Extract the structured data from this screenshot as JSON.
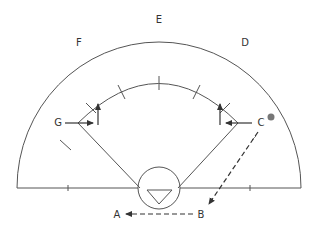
{
  "diagram": {
    "type": "field-positions-diagram",
    "colors": {
      "line": "#555555",
      "label": "#333333",
      "dot": "#777777",
      "background": "#ffffff"
    },
    "labels": {
      "E": "E",
      "F": "F",
      "D": "D",
      "G": "G",
      "C": "C",
      "A": "A",
      "B": "B"
    },
    "elements": {
      "outer_arc": "semicircle boundary",
      "inner_arc": "inner arc with tick marks",
      "center_circle": "circle with inverted triangle",
      "dot_near_C": "gray filled dot",
      "path_C_to_B": "dashed arrow",
      "path_B_to_A": "dashed arrow"
    }
  }
}
